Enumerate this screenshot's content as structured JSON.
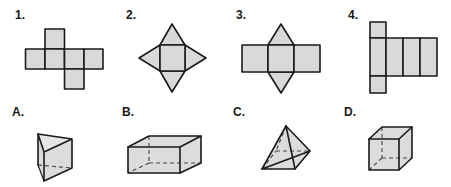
{
  "nets": [
    {
      "label": "1.",
      "shape": "cube-net",
      "description": "cross-shaped net of six squares"
    },
    {
      "label": "2.",
      "shape": "square-pyramid-net",
      "description": "square with four triangles"
    },
    {
      "label": "3.",
      "shape": "triangular-prism-net",
      "description": "three rectangles with two triangles"
    },
    {
      "label": "4.",
      "shape": "rectangular-prism-net",
      "description": "four rectangles with two squares"
    }
  ],
  "solids": [
    {
      "label": "A.",
      "shape": "triangular-prism"
    },
    {
      "label": "B.",
      "shape": "rectangular-prism"
    },
    {
      "label": "C.",
      "shape": "square-pyramid"
    },
    {
      "label": "D.",
      "shape": "cube"
    }
  ],
  "colors": {
    "fill": "#d9d9d9",
    "stroke": "#1a1a1a"
  }
}
